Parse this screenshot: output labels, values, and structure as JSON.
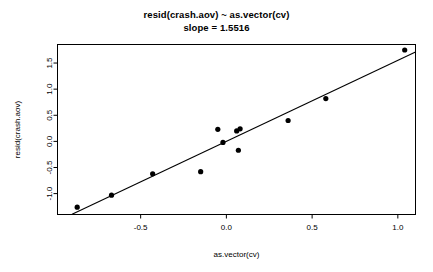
{
  "chart_data": {
    "type": "scatter",
    "title": "resid(crash.aov) ~ as.vector(cv)",
    "subtitle": "slope = 1.5516",
    "xlabel": "as.vector(cv)",
    "ylabel": "resid(crash.aov)",
    "xlim": [
      -0.985,
      1.103
    ],
    "ylim": [
      -1.4,
      1.855
    ],
    "xticks": [
      -0.5,
      0.0,
      0.5,
      1.0
    ],
    "xtick_labels": [
      "-0.5",
      "0.0",
      "0.5",
      "1.0"
    ],
    "yticks": [
      -1.0,
      -0.5,
      0.0,
      0.5,
      1.0,
      1.5
    ],
    "ytick_labels": [
      "-1.0",
      "-0.5",
      "0.0",
      "0.5",
      "1.0",
      "1.5"
    ],
    "grid": false,
    "legend": null,
    "slope": 1.5516,
    "intercept": 0.0,
    "series": [
      {
        "name": "residuals",
        "marker": "filled-circle",
        "color": "#000000",
        "x": [
          -0.87,
          -0.67,
          -0.43,
          -0.15,
          -0.05,
          -0.02,
          0.07,
          0.06,
          0.08,
          0.36,
          0.58,
          1.04
        ],
        "y": [
          -1.26,
          -1.03,
          -0.62,
          -0.58,
          0.23,
          -0.02,
          -0.17,
          0.2,
          0.24,
          0.4,
          0.82,
          1.75
        ]
      }
    ],
    "fit_line": {
      "name": "least-squares fit",
      "x": [
        -0.9,
        1.103
      ],
      "y": [
        -1.396,
        1.712
      ]
    }
  },
  "axis": {
    "x_title": "as.vector(cv)",
    "y_title": "resid(crash.aov)"
  }
}
